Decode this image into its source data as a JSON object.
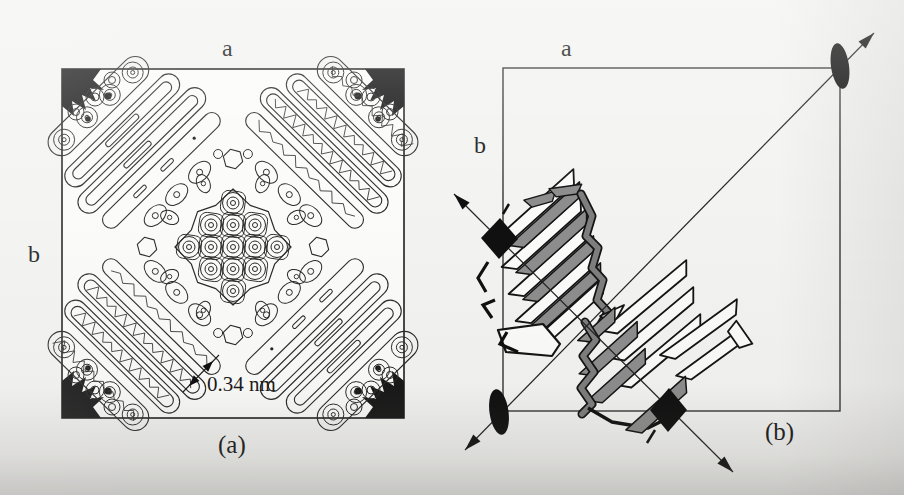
{
  "figure": {
    "panel_a": {
      "top_axis_label": "a",
      "left_axis_label": "b",
      "caption": "(a)",
      "distance_annotation": "0.34 nm"
    },
    "panel_b": {
      "top_axis_label": "a",
      "left_axis_label": "b",
      "caption": "(b)"
    },
    "colors": {
      "ink": "#1e1e1e",
      "contour_line": "#2a2a2a",
      "slat_gray": "#8d8d8d",
      "spine_gray": "#7e7e7e",
      "symbol_black": "#101010",
      "map_paper": "#fbfbfa"
    }
  }
}
